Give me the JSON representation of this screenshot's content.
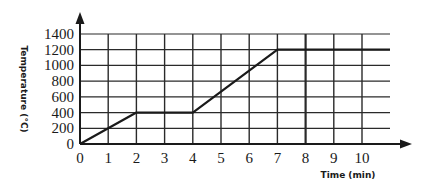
{
  "chart_data": {
    "type": "line",
    "title": "",
    "xlabel": "Time (min)",
    "ylabel": "Temperature (°C)",
    "x_ticks": [
      0,
      1,
      2,
      3,
      4,
      5,
      6,
      7,
      8,
      9,
      10
    ],
    "y_ticks": [
      0,
      200,
      400,
      600,
      800,
      1000,
      1200,
      1400
    ],
    "xlim": [
      0,
      11
    ],
    "ylim": [
      0,
      1400
    ],
    "grid": true,
    "legend": null,
    "series": [
      {
        "name": "Temperature",
        "x": [
          0,
          2,
          4,
          7,
          11
        ],
        "y": [
          0,
          400,
          400,
          1200,
          1200
        ]
      }
    ],
    "colors": {
      "line": "#1a1a1a",
      "grid": "#2a2a2a",
      "background": "#ffffff"
    }
  }
}
